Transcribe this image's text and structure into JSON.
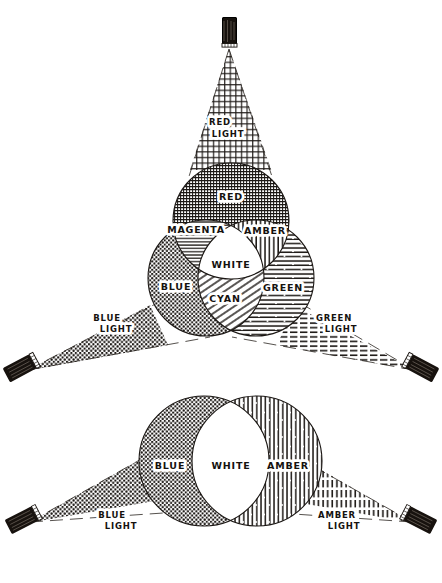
{
  "figure": {
    "domain": "diagram",
    "ink_color": "#15120f",
    "paper_color": "#ffffff"
  },
  "top_diagram": {
    "name": "three-lamp-additive-mixing",
    "lamps": [
      {
        "id": "lamp-red",
        "label_line1": "RED",
        "label_line2": "LIGHT",
        "beam_pattern": "cross-hatch",
        "position": "top"
      },
      {
        "id": "lamp-blue",
        "label_line1": "BLUE",
        "label_line2": "LIGHT",
        "beam_pattern": "stipple-dots",
        "position": "bottom-left"
      },
      {
        "id": "lamp-green",
        "label_line1": "GREEN",
        "label_line2": "LIGHT",
        "beam_pattern": "horizontal-lines",
        "position": "bottom-right"
      }
    ],
    "circles": [
      {
        "id": "circle-red",
        "label": "RED",
        "pattern": "cross-hatch"
      },
      {
        "id": "circle-blue",
        "label": "BLUE",
        "pattern": "stipple-dots"
      },
      {
        "id": "circle-green",
        "label": "GREEN",
        "pattern": "horizontal-lines"
      }
    ],
    "overlap_regions": [
      {
        "id": "region-magenta",
        "label": "MAGENTA",
        "mix": "RED + BLUE",
        "pattern": "horizontal-lines-fine"
      },
      {
        "id": "region-amber",
        "label": "AMBER",
        "mix": "RED + GREEN",
        "pattern": "vertical-lines"
      },
      {
        "id": "region-cyan",
        "label": "CYAN",
        "mix": "BLUE + GREEN",
        "pattern": "diagonal-lines"
      },
      {
        "id": "region-white",
        "label": "WHITE",
        "mix": "RED + BLUE + GREEN",
        "pattern": "blank"
      }
    ]
  },
  "bottom_diagram": {
    "name": "two-lamp-complementary-mixing",
    "lamps": [
      {
        "id": "lamp-blue-2",
        "label_line1": "BLUE",
        "label_line2": "LIGHT",
        "beam_pattern": "stipple-dots",
        "position": "bottom-left"
      },
      {
        "id": "lamp-amber-2",
        "label_line1": "AMBER",
        "label_line2": "LIGHT",
        "beam_pattern": "vertical-lines",
        "position": "bottom-right"
      }
    ],
    "circles": [
      {
        "id": "circle-blue-2",
        "label": "BLUE",
        "pattern": "stipple-dots"
      },
      {
        "id": "circle-amber-2",
        "label": "AMBER",
        "pattern": "vertical-lines"
      }
    ],
    "overlap_regions": [
      {
        "id": "region-white-2",
        "label": "WHITE",
        "mix": "BLUE + AMBER",
        "pattern": "blank"
      }
    ]
  }
}
